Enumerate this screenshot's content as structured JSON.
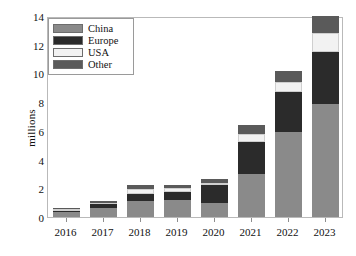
{
  "chart_data": {
    "type": "bar",
    "subtype": "stacked-vertical",
    "title": "",
    "xlabel": "",
    "ylabel": "millions",
    "ylim": [
      0,
      14
    ],
    "yticks": [
      0,
      2,
      4,
      6,
      8,
      10,
      12,
      14
    ],
    "ytick_labels": [
      "0",
      "2",
      "4",
      "6",
      "8",
      "10",
      "12",
      "14"
    ],
    "grid": false,
    "legend_position": "upper left",
    "categories": [
      "2016",
      "2017",
      "2018",
      "2019",
      "2020",
      "2021",
      "2022",
      "2023"
    ],
    "series": [
      {
        "name": "China",
        "color": "#8a8a8a",
        "values": [
          0.35,
          0.6,
          1.1,
          1.2,
          1.0,
          3.0,
          5.9,
          7.9
        ]
      },
      {
        "name": "Europe",
        "color": "#2b2b2b",
        "values": [
          0.1,
          0.3,
          0.5,
          0.55,
          1.2,
          2.2,
          2.8,
          3.6
        ]
      },
      {
        "name": "USA",
        "color": "#f2f2f2",
        "values": [
          0.1,
          0.1,
          0.35,
          0.25,
          0.2,
          0.6,
          0.7,
          1.3
        ]
      },
      {
        "name": "Other",
        "color": "#5a5a5a",
        "values": [
          0.05,
          0.1,
          0.25,
          0.2,
          0.25,
          0.6,
          0.8,
          1.2
        ]
      }
    ],
    "totals": [
      0.6,
      1.1,
      2.2,
      2.2,
      2.65,
      6.4,
      10.2,
      14.0
    ],
    "legend_entries": [
      "China",
      "Europe",
      "USA",
      "Other"
    ]
  },
  "colors": {
    "china": "#8a8a8a",
    "europe": "#2b2b2b",
    "usa": "#f2f2f2",
    "other": "#5a5a5a",
    "frame": "#b9b9b9",
    "tick": "#8e8e8e",
    "text": "#111111",
    "background": "#ffffff"
  }
}
